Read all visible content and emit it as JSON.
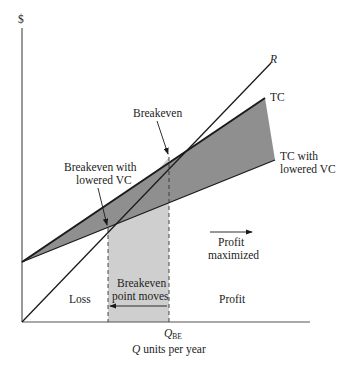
{
  "diagram": {
    "type": "breakeven-analysis",
    "axes": {
      "y_label": "$",
      "x_label_var": "Q",
      "x_label_rest": " units per year",
      "x_tick_main": "Q",
      "x_tick_sub": "BE"
    },
    "lines": {
      "revenue": "R",
      "total_cost": "TC",
      "tc_lowered_line1": "TC with",
      "tc_lowered_line2": "lowered VC"
    },
    "annotations": {
      "breakeven": "Breakeven",
      "breakeven_lowered_line1": "Breakeven with",
      "breakeven_lowered_line2": "lowered VC",
      "moves_line1": "Breakeven",
      "moves_line2": "point moves",
      "profit_max_line1": "Profit",
      "profit_max_line2": "maximized",
      "loss": "Loss",
      "profit": "Profit"
    },
    "colors": {
      "dark_fill": "#8f8f8f",
      "light_fill": "#c9c9c9",
      "line": "#1a1a1a",
      "axis": "#555555"
    }
  }
}
